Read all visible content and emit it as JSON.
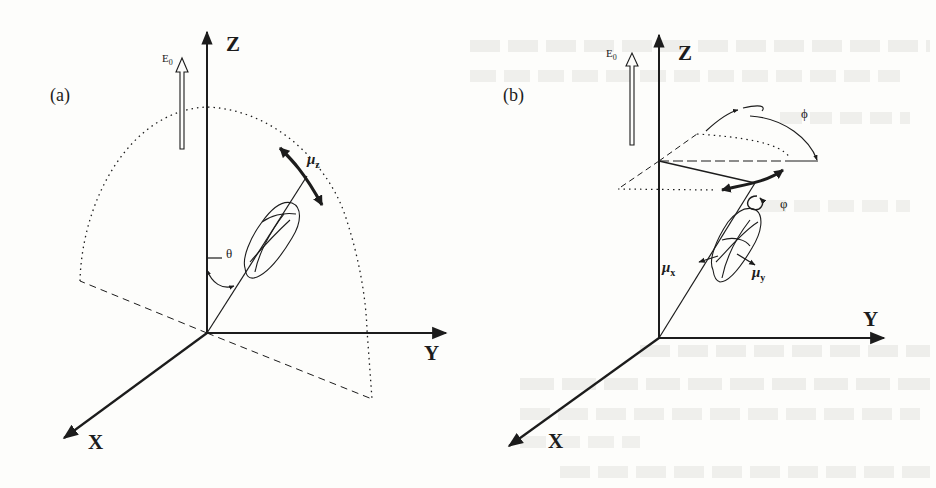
{
  "figure": {
    "panel_a": {
      "label": "(a)",
      "axes": {
        "z": "Z",
        "y": "Y",
        "x": "X"
      },
      "field_label": "E0",
      "field_label_main": "E",
      "field_label_sub": "0",
      "dipole_label_main": "μ",
      "dipole_label_sub": "z",
      "angle_label": "θ"
    },
    "panel_b": {
      "label": "(b)",
      "axes": {
        "z": "Z",
        "y": "Y",
        "x": "X"
      },
      "field_label_main": "E",
      "field_label_sub": "0",
      "precession_angle_label": "ϕ",
      "spin_angle_label": "φ",
      "dipole_x_main": "μ",
      "dipole_x_sub": "x",
      "dipole_y_main": "μ",
      "dipole_y_sub": "y"
    },
    "colors": {
      "ink": "#1c1c1c",
      "paper": "#fdfdfb",
      "bleed_through": "#e6e6e3"
    }
  }
}
